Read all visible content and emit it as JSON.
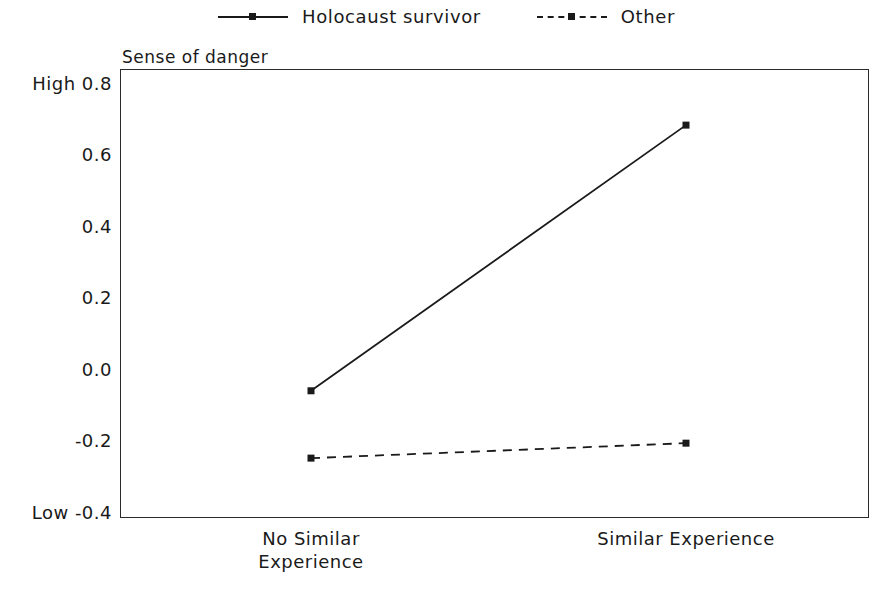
{
  "chart_data": {
    "type": "line",
    "title": "",
    "ylabel": "Sense of danger",
    "xlabel": "",
    "categories": [
      "No Similar Experience",
      "Similar Experience"
    ],
    "category_lines": [
      [
        "No Similar",
        "Experience"
      ],
      [
        "Similar Experience"
      ]
    ],
    "ylim": [
      -0.4,
      0.8
    ],
    "yticks": [
      -0.4,
      -0.2,
      0.0,
      0.2,
      0.4,
      0.6,
      0.8
    ],
    "ytick_labels": [
      "-0.4",
      "-0.2",
      "0.0",
      "0.2",
      "0.4",
      "0.6",
      "0.8"
    ],
    "y_axis_low_label": "Low",
    "y_axis_high_label": "High",
    "grid": false,
    "legend_position": "top-center",
    "series": [
      {
        "name": "Holocaust survivor",
        "linestyle": "solid",
        "marker": "square",
        "color": "#1a1a1a",
        "values": [
          -0.06,
          0.65
        ]
      },
      {
        "name": "Other",
        "linestyle": "dashed",
        "marker": "square",
        "color": "#1a1a1a",
        "values": [
          -0.24,
          -0.2
        ]
      }
    ]
  },
  "legend": {
    "entries": [
      {
        "label": "Holocaust survivor",
        "style": "solid"
      },
      {
        "label": "Other",
        "style": "dashed"
      }
    ]
  },
  "axis": {
    "y_title": "Sense of danger",
    "high_label": "High",
    "low_label": "Low",
    "tick_0_8": "0.8",
    "tick_0_6": "0.6",
    "tick_0_4": "0.4",
    "tick_0_2": "0.2",
    "tick_0_0": "0.0",
    "tick_m0_2": "-0.2",
    "tick_m0_4": "-0.4",
    "x_label_left": "No Similar\nExperience",
    "x_label_right": "Similar Experience"
  }
}
